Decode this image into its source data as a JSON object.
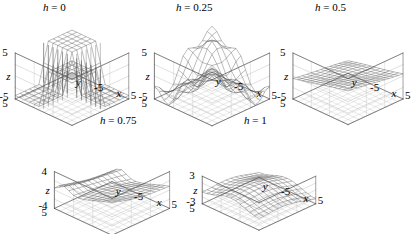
{
  "figure": {
    "background": "#ffffff",
    "line_color": "#555555",
    "axis_color": "#444444",
    "text_color": "#000000"
  },
  "chart_data": {
    "type": "line",
    "title": "",
    "subtitle": "",
    "plot_kind": "3d-wireframe-surface-grid",
    "layout": {
      "rows": 2,
      "cols": 3,
      "panels_top": 3,
      "panels_bottom": 2,
      "grid": false,
      "legend": "none"
    },
    "shared": {
      "xlabel": "x",
      "ylabel": "y",
      "zlabel": "z",
      "xlim": [
        -5,
        5
      ],
      "ylim": [
        -5,
        5
      ],
      "xticks": [
        "-5",
        "5"
      ],
      "yticks": [
        "-5",
        "5"
      ],
      "mesh_nx": 13,
      "mesh_ny": 13,
      "elev": 30,
      "azim": -60
    },
    "panels": [
      {
        "id": "panel-h-0",
        "title": "h = 0",
        "param_symbol": "h",
        "param_value": "0",
        "zlim": [
          -5,
          5
        ],
        "zticks": [
          "-5",
          "5"
        ],
        "ztick_top": "5",
        "ztick_bottom": "-5",
        "ycorner_tick": "5",
        "xfar_tick": "5",
        "xnear_tick": "-5",
        "description": "Sharp step / sign-like surface with vertical cliff walls; plateaus at +/-5 separated by abrupt discontinuities.",
        "surface_model": "step",
        "amplitude": 5.0,
        "sharpness": 0.0
      },
      {
        "id": "panel-h-025",
        "title": "h = 0.25",
        "param_symbol": "h",
        "param_value": "0.25",
        "zlim": [
          -5,
          5
        ],
        "zticks": [
          "-5",
          "5"
        ],
        "ztick_top": "5",
        "ztick_bottom": "-5",
        "ycorner_tick": "5",
        "xfar_tick": "5",
        "xnear_tick": "-5",
        "description": "Smoothed step with visible ripples and oscillating ridges across the domain.",
        "surface_model": "smoothed-step",
        "amplitude": 4.6,
        "sharpness": 0.25
      },
      {
        "id": "panel-h-05",
        "title": "h = 0.5",
        "param_symbol": "h",
        "param_value": "0.5",
        "zlim": [
          -5,
          5
        ],
        "zticks": [
          "-5",
          "5"
        ],
        "ztick_top": "5",
        "ztick_bottom": "-5",
        "ycorner_tick": "5",
        "xfar_tick": "5",
        "xnear_tick": "-5",
        "description": "Nearly flat tilted plane with a gentle saddle; surface largely smoothed out.",
        "surface_model": "tilted-plane",
        "amplitude": 2.4,
        "sharpness": 0.5
      },
      {
        "id": "panel-h-075",
        "title": "h = 0.75",
        "param_symbol": "h",
        "param_value": "0.75",
        "zlim": [
          -4,
          4
        ],
        "zticks": [
          "-4",
          "4"
        ],
        "ztick_top": "4",
        "ztick_bottom": "-4",
        "ycorner_tick": "5",
        "xfar_tick": "5",
        "xnear_tick": "-5",
        "description": "Curved sheet rising toward the far corner with a fold along the left edge.",
        "surface_model": "folded-sheet",
        "amplitude": 3.6,
        "sharpness": 0.75
      },
      {
        "id": "panel-h-1",
        "title": "h = 1",
        "param_symbol": "h",
        "param_value": "1",
        "zlim": [
          -3,
          3
        ],
        "zticks": [
          "-3",
          "3"
        ],
        "ztick_top": "3",
        "ztick_bottom": "-3",
        "ycorner_tick": "5",
        "xfar_tick": "5",
        "xnear_tick": "-5",
        "description": "Broad smooth wave with a raised back wall and shallow basin in front.",
        "surface_model": "wave",
        "amplitude": 3.0,
        "sharpness": 1.0
      }
    ]
  }
}
